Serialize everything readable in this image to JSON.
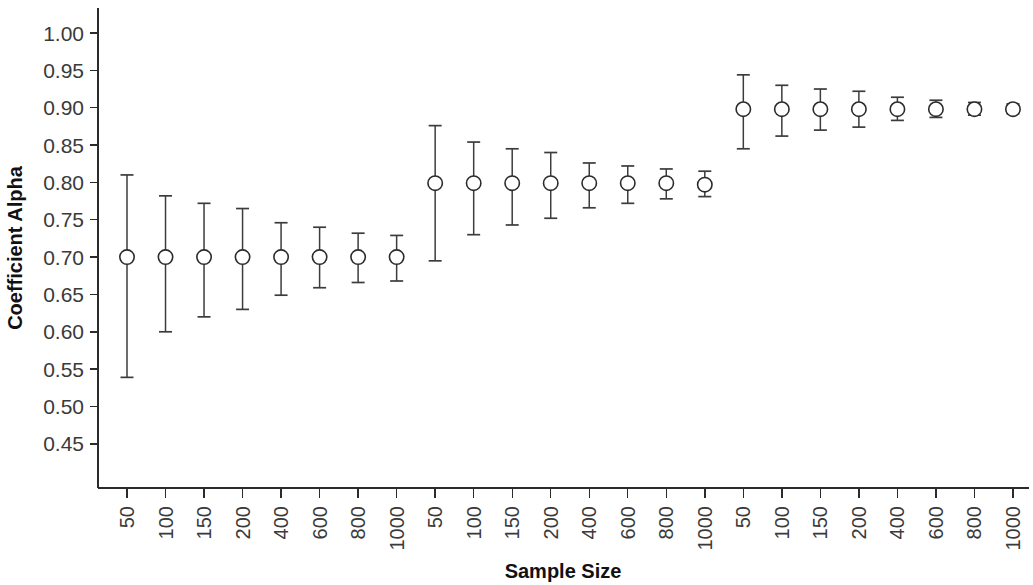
{
  "chart_data": {
    "type": "scatter",
    "title": "",
    "xlabel": "Sample Size",
    "ylabel": "Coefficient Alpha",
    "ylim": [
      0.425,
      1.025
    ],
    "yticks": [
      1.0,
      0.95,
      0.9,
      0.85,
      0.8,
      0.75,
      0.7,
      0.65,
      0.6,
      0.55,
      0.5,
      0.45
    ],
    "ytick_labels": [
      "1.00",
      "0.95",
      "0.90",
      "0.85",
      "0.80",
      "0.75",
      "0.70",
      "0.65",
      "0.60",
      "0.55",
      "0.50",
      "0.45"
    ],
    "xtick_labels": [
      "50",
      "100",
      "150",
      "200",
      "400",
      "600",
      "800",
      "1000",
      "50",
      "100",
      "150",
      "200",
      "400",
      "600",
      "800",
      "1000",
      "50",
      "100",
      "150",
      "200",
      "400",
      "600",
      "800",
      "1000"
    ],
    "grid": false,
    "legend": "none",
    "marker_style": "open-circle",
    "error_bar_style": "capped-vertical",
    "points": [
      {
        "index": 1,
        "x_label": "50",
        "group": "alpha-0.70",
        "value": 0.7,
        "low": 0.539,
        "high": 0.81
      },
      {
        "index": 2,
        "x_label": "100",
        "group": "alpha-0.70",
        "value": 0.7,
        "low": 0.6,
        "high": 0.782
      },
      {
        "index": 3,
        "x_label": "150",
        "group": "alpha-0.70",
        "value": 0.7,
        "low": 0.62,
        "high": 0.772
      },
      {
        "index": 4,
        "x_label": "200",
        "group": "alpha-0.70",
        "value": 0.7,
        "low": 0.63,
        "high": 0.765
      },
      {
        "index": 5,
        "x_label": "400",
        "group": "alpha-0.70",
        "value": 0.7,
        "low": 0.649,
        "high": 0.746
      },
      {
        "index": 6,
        "x_label": "600",
        "group": "alpha-0.70",
        "value": 0.7,
        "low": 0.659,
        "high": 0.74
      },
      {
        "index": 7,
        "x_label": "800",
        "group": "alpha-0.70",
        "value": 0.7,
        "low": 0.666,
        "high": 0.732
      },
      {
        "index": 8,
        "x_label": "1000",
        "group": "alpha-0.70",
        "value": 0.7,
        "low": 0.668,
        "high": 0.729
      },
      {
        "index": 9,
        "x_label": "50",
        "group": "alpha-0.80",
        "value": 0.799,
        "low": 0.695,
        "high": 0.876
      },
      {
        "index": 10,
        "x_label": "100",
        "group": "alpha-0.80",
        "value": 0.799,
        "low": 0.73,
        "high": 0.854
      },
      {
        "index": 11,
        "x_label": "150",
        "group": "alpha-0.80",
        "value": 0.799,
        "low": 0.743,
        "high": 0.845
      },
      {
        "index": 12,
        "x_label": "200",
        "group": "alpha-0.80",
        "value": 0.799,
        "low": 0.752,
        "high": 0.84
      },
      {
        "index": 13,
        "x_label": "400",
        "group": "alpha-0.80",
        "value": 0.799,
        "low": 0.766,
        "high": 0.826
      },
      {
        "index": 14,
        "x_label": "600",
        "group": "alpha-0.80",
        "value": 0.799,
        "low": 0.772,
        "high": 0.822
      },
      {
        "index": 15,
        "x_label": "800",
        "group": "alpha-0.80",
        "value": 0.799,
        "low": 0.778,
        "high": 0.818
      },
      {
        "index": 16,
        "x_label": "1000",
        "group": "alpha-0.80",
        "value": 0.797,
        "low": 0.781,
        "high": 0.815
      },
      {
        "index": 17,
        "x_label": "50",
        "group": "alpha-0.90",
        "value": 0.898,
        "low": 0.845,
        "high": 0.944
      },
      {
        "index": 18,
        "x_label": "100",
        "group": "alpha-0.90",
        "value": 0.898,
        "low": 0.862,
        "high": 0.93
      },
      {
        "index": 19,
        "x_label": "150",
        "group": "alpha-0.90",
        "value": 0.898,
        "low": 0.87,
        "high": 0.925
      },
      {
        "index": 20,
        "x_label": "200",
        "group": "alpha-0.90",
        "value": 0.898,
        "low": 0.874,
        "high": 0.922
      },
      {
        "index": 21,
        "x_label": "400",
        "group": "alpha-0.90",
        "value": 0.898,
        "low": 0.883,
        "high": 0.914
      },
      {
        "index": 22,
        "x_label": "600",
        "group": "alpha-0.90",
        "value": 0.898,
        "low": 0.887,
        "high": 0.91
      },
      {
        "index": 23,
        "x_label": "800",
        "group": "alpha-0.90",
        "value": 0.898,
        "low": 0.89,
        "high": 0.907
      },
      {
        "index": 24,
        "x_label": "1000",
        "group": "alpha-0.90",
        "value": 0.898,
        "low": 0.892,
        "high": 0.905
      }
    ]
  },
  "colors": {
    "background": "#ffffff",
    "axis": "#2b2b2b",
    "marker_fill": "#ffffff",
    "marker_stroke": "#2b2b2b",
    "error_bar": "#3c3c3c",
    "tick_text": "#3a3a3a",
    "title_text": "#111111"
  }
}
